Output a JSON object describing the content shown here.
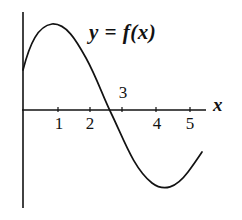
{
  "figure": {
    "name": "graph-of-y-equals-f-of-x",
    "background_color": "#ffffff",
    "ink_color": "#121212"
  },
  "labels": {
    "function_label": "y = f(x)",
    "x_axis_label": "x"
  },
  "chart_data": {
    "type": "line",
    "title": "",
    "subtitle": "",
    "xlabel": "x",
    "ylabel": "",
    "grid": false,
    "legend": null,
    "annotations": [
      {
        "text": "y = f(x)",
        "x": 2.2,
        "y": 2.45,
        "style": "italic-math"
      }
    ],
    "axes": {
      "x_axis_drawn": true,
      "y_axis_drawn": true,
      "x_tick_values": [
        1,
        2,
        3,
        4,
        5
      ],
      "x_tick_labels": [
        "1",
        "2",
        "3",
        "4",
        "5"
      ],
      "x_tick_label_positions": [
        "below",
        "below",
        "above",
        "below",
        "below"
      ],
      "y_tick_values": [],
      "y_tick_labels": [],
      "xlim": [
        -0.2,
        5.7
      ],
      "ylim": [
        -2.9,
        3.1
      ]
    },
    "series": [
      {
        "name": "f(x)",
        "color": "#121212",
        "line_width": 1.6,
        "x": [
          0.0,
          0.25,
          0.5,
          0.75,
          1.0,
          1.25,
          1.5,
          1.75,
          2.0,
          2.25,
          2.5,
          2.75,
          3.0,
          3.25,
          3.5,
          3.75,
          4.0,
          4.25,
          4.5,
          4.75,
          5.0,
          5.25,
          5.5
        ],
        "y": [
          1.35,
          2.05,
          2.52,
          2.72,
          2.72,
          2.5,
          2.05,
          1.45,
          0.78,
          0.12,
          -0.55,
          -1.2,
          -1.75,
          -2.18,
          -2.45,
          -2.58,
          -2.6,
          -2.48,
          -2.2,
          -1.8,
          -1.3,
          -0.78,
          -0.3
        ]
      }
    ],
    "features": {
      "local_maximum": {
        "x": 0.9,
        "y": 2.72
      },
      "local_minimum": {
        "x": 4.05,
        "y": -2.6
      },
      "x_intercept": {
        "x": 2.55,
        "y": 0.0
      },
      "y_intercept": {
        "x": 0.0,
        "y": 1.35
      }
    }
  },
  "ticks": [
    {
      "label": "1",
      "left": 49,
      "placement": "below"
    },
    {
      "label": "2",
      "left": 80,
      "placement": "below"
    },
    {
      "label": "3",
      "left": 113,
      "placement": "above"
    },
    {
      "label": "4",
      "left": 147,
      "placement": "below"
    },
    {
      "label": "5",
      "left": 180,
      "placement": "below"
    }
  ],
  "geometry": {
    "y_axis_x": 23,
    "y_axis_top": 12,
    "y_axis_bottom": 208,
    "x_axis_y": 110,
    "x_axis_left": 22,
    "x_axis_right": 206,
    "tick_pixel_x": [
      58,
      90,
      122,
      156,
      190
    ],
    "curve_path": "M 23,70 C 30,43 38,26 52,24 C 66,23 76,40 86,58 C 97,78 103,97 112,115 C 124,140 134,169 152,183 C 164,192 176,188 188,172 C 194,164 198,158 202,152"
  }
}
